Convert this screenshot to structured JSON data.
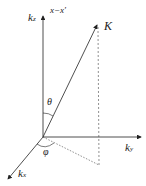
{
  "diagram": {
    "labels": {
      "kz": {
        "main": "k",
        "sub": "z"
      },
      "axis_top": "x−x′",
      "K": "K",
      "theta": "θ",
      "phi": "φ",
      "ky": {
        "main": "k",
        "sub": "y"
      },
      "kx": {
        "main": "k",
        "sub": "x"
      }
    }
  }
}
